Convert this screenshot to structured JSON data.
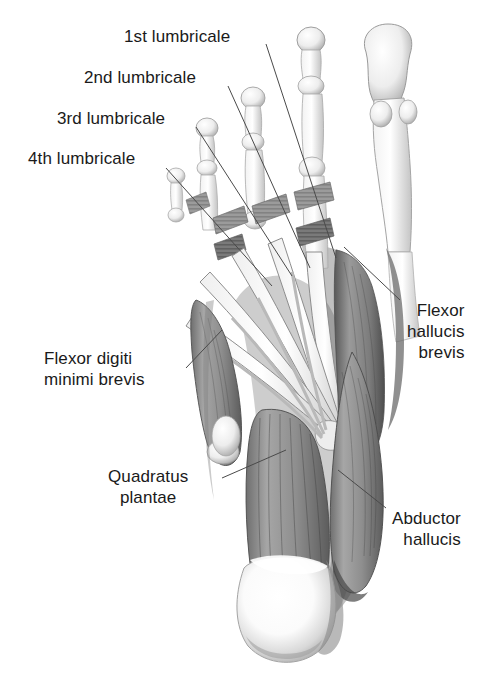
{
  "figure": {
    "background_color": "#ffffff",
    "text_color": "#1a1a1a",
    "leader_color": "#4a4a4a"
  },
  "labels": [
    {
      "id": "first-lumbricale",
      "text": "1st lumbricale",
      "lines": [
        "1st lumbricale"
      ],
      "align": "right",
      "x": 124,
      "y": 26,
      "leader": {
        "x1": 266,
        "y1": 44,
        "x2": 336,
        "y2": 258
      }
    },
    {
      "id": "second-lumbricale",
      "text": "2nd lumbricale",
      "lines": [
        "2nd lumbricale"
      ],
      "align": "right",
      "x": 84,
      "y": 67,
      "leader": {
        "x1": 228,
        "y1": 86,
        "x2": 310,
        "y2": 268
      }
    },
    {
      "id": "third-lumbricale",
      "text": "3rd lumbricale",
      "lines": [
        "3rd lumbricale"
      ],
      "align": "right",
      "x": 57,
      "y": 108,
      "leader": {
        "x1": 196,
        "y1": 127,
        "x2": 292,
        "y2": 276
      }
    },
    {
      "id": "fourth-lumbricale",
      "text": "4th lumbricale",
      "lines": [
        "4th lumbricale"
      ],
      "align": "right",
      "x": 28,
      "y": 148,
      "leader": {
        "x1": 166,
        "y1": 168,
        "x2": 272,
        "y2": 286
      }
    },
    {
      "id": "flexor-hallucis-brevis",
      "text": "Flexor hallucis brevis",
      "lines": [
        "Flexor",
        "hallucis",
        "brevis"
      ],
      "align": "left",
      "x": 407,
      "y": 300,
      "leader": {
        "x1": 400,
        "y1": 300,
        "x2": 344,
        "y2": 247
      }
    },
    {
      "id": "flexor-digiti-minimi-brevis",
      "text": "Flexor digiti minimi brevis",
      "lines": [
        "Flexor digiti",
        "minimi brevis"
      ],
      "align": "right",
      "x": 44,
      "y": 348,
      "leader": {
        "x1": 186,
        "y1": 368,
        "x2": 222,
        "y2": 330
      }
    },
    {
      "id": "quadratus-plantae",
      "text": "Quadratus plantae",
      "lines": [
        "Quadratus",
        "plantae"
      ],
      "align": "center",
      "x": 108,
      "y": 466,
      "leader": {
        "x1": 222,
        "y1": 478,
        "x2": 286,
        "y2": 450
      }
    },
    {
      "id": "abductor-hallucis",
      "text": "Abductor hallucis",
      "lines": [
        "Abductor",
        "hallucis"
      ],
      "align": "left",
      "x": 392,
      "y": 508,
      "leader": {
        "x1": 386,
        "y1": 508,
        "x2": 338,
        "y2": 470
      }
    }
  ]
}
